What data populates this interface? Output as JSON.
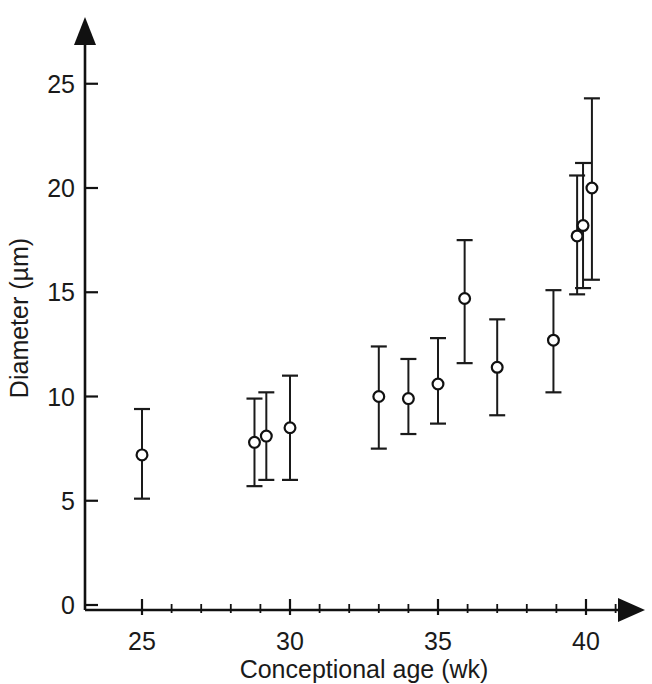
{
  "chart_data": {
    "type": "scatter",
    "title": "",
    "subtitle": "",
    "xlabel": "Conceptional age (wk)",
    "ylabel": "Diameter (µm)",
    "xlim": [
      23.6,
      41.4
    ],
    "ylim": [
      0,
      26.5
    ],
    "x_major_ticks": [
      25,
      30,
      35,
      40
    ],
    "x_major_tick_labels": [
      "25",
      "30",
      "35",
      "40"
    ],
    "x_minor_ticks": [
      26,
      27,
      28,
      29,
      31,
      32,
      33,
      34,
      36,
      37,
      38,
      39,
      41
    ],
    "y_major_ticks": [
      0,
      5,
      10,
      15,
      20,
      25
    ],
    "y_major_tick_labels": [
      "0",
      "5",
      "10",
      "15",
      "20",
      "25"
    ],
    "grid": false,
    "legend": false,
    "legend_position": "none",
    "marker": "open-circle",
    "error_bars": "vertical-capped",
    "axis_style": "arrow-ended",
    "series": [
      {
        "name": "Diameter",
        "points": [
          {
            "x": 25.0,
            "y": 7.2,
            "y_low": 5.1,
            "y_high": 9.4
          },
          {
            "x": 28.8,
            "y": 7.8,
            "y_low": 5.7,
            "y_high": 9.9
          },
          {
            "x": 29.2,
            "y": 8.1,
            "y_low": 6.0,
            "y_high": 10.2
          },
          {
            "x": 30.0,
            "y": 8.5,
            "y_low": 6.0,
            "y_high": 11.0
          },
          {
            "x": 33.0,
            "y": 10.0,
            "y_low": 7.5,
            "y_high": 12.4
          },
          {
            "x": 34.0,
            "y": 9.9,
            "y_low": 8.2,
            "y_high": 11.8
          },
          {
            "x": 35.0,
            "y": 10.6,
            "y_low": 8.7,
            "y_high": 12.8
          },
          {
            "x": 35.9,
            "y": 14.7,
            "y_low": 11.6,
            "y_high": 17.5
          },
          {
            "x": 37.0,
            "y": 11.4,
            "y_low": 9.1,
            "y_high": 13.7
          },
          {
            "x": 38.9,
            "y": 12.7,
            "y_low": 10.2,
            "y_high": 15.1
          },
          {
            "x": 39.7,
            "y": 17.7,
            "y_low": 14.9,
            "y_high": 20.6
          },
          {
            "x": 39.9,
            "y": 18.2,
            "y_low": 15.2,
            "y_high": 21.2
          },
          {
            "x": 40.2,
            "y": 20.0,
            "y_low": 15.6,
            "y_high": 24.3
          }
        ]
      }
    ]
  }
}
